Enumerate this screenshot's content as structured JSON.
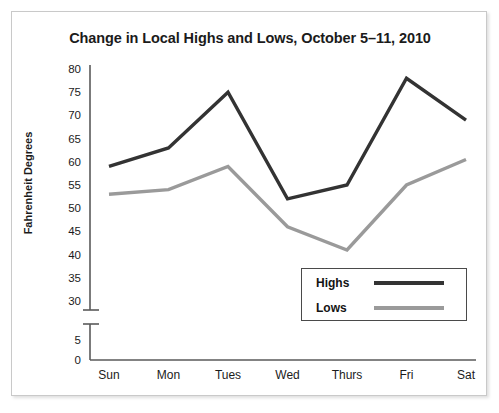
{
  "chart_data": {
    "type": "line",
    "title": "Change in Local Highs and Lows, October 5–11, 2010",
    "xlabel": "",
    "ylabel": "Fahrenheit Degrees",
    "categories": [
      "Sun",
      "Mon",
      "Tues",
      "Wed",
      "Thurs",
      "Fri",
      "Sat"
    ],
    "series": [
      {
        "name": "Highs",
        "values": [
          59,
          63,
          75,
          52,
          55,
          78,
          69
        ],
        "color": "#333333"
      },
      {
        "name": "Lows",
        "values": [
          53,
          54,
          59,
          46,
          41,
          55,
          60.5
        ],
        "color": "#9a9a9a"
      }
    ],
    "ytick_labels": [
      "80",
      "75",
      "70",
      "65",
      "60",
      "55",
      "50",
      "45",
      "40",
      "35",
      "30",
      "5",
      "0"
    ],
    "ytick_values": [
      80,
      75,
      70,
      65,
      60,
      55,
      50,
      45,
      40,
      35,
      30,
      5,
      0
    ],
    "ylim": [
      30,
      80
    ],
    "axis_break": true,
    "grid": false,
    "legend_position": "lower-right",
    "legend_entries": [
      "Highs",
      "Lows"
    ]
  },
  "axis": {
    "y_title": "Fahrenheit Degrees"
  },
  "legend": {
    "highs_label": "Highs",
    "lows_label": "Lows"
  },
  "colors": {
    "highs": "#333333",
    "lows": "#9a9a9a",
    "axis": "#5a5a5a",
    "text": "#1b1b1b",
    "frame": "#c9c9c9"
  }
}
